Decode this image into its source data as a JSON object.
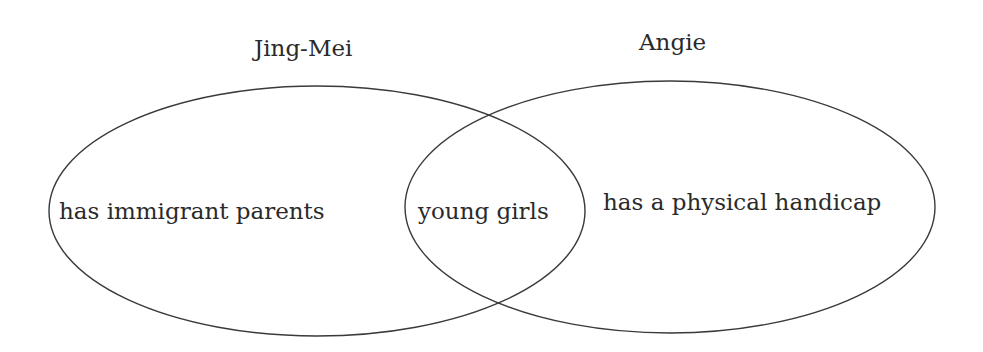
{
  "diagram": {
    "type": "venn",
    "sets": [
      {
        "name": "Jing-Mei",
        "unique_trait": "has immigrant parents"
      },
      {
        "name": "Angie",
        "unique_trait": "has a physical handicap"
      }
    ],
    "intersection": "young girls",
    "colors": {
      "stroke": "#3a3a3a",
      "text": "#2a2a2a",
      "background": "#ffffff"
    }
  }
}
